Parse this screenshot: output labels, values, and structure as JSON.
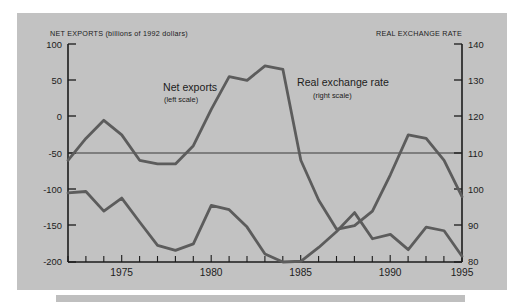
{
  "figure": {
    "left_header": "NET EXPORTS (billions of 1992 dollars)",
    "right_header": "REAL EXCHANGE RATE",
    "panel_color": "#c2c2c2",
    "line_color": "#5c5c5c",
    "axis_color": "#1b1b1b"
  },
  "annotations": {
    "net_exports_label": "Net exports",
    "net_exports_sub": "(left scale)",
    "real_rate_label": "Real exchange rate",
    "real_rate_sub": "(right scale)"
  },
  "axis": {
    "left_ticks": [
      "100",
      "50",
      "0",
      "-50",
      "-100",
      "-150",
      "-200"
    ],
    "right_ticks": [
      "140",
      "130",
      "120",
      "110",
      "100",
      "90",
      "80"
    ],
    "x_ticks": [
      "1975",
      "1980",
      "1985",
      "1990",
      "1995"
    ]
  },
  "chart_data": {
    "type": "line",
    "xlabel": "",
    "ylabel": "Net exports (billions of 1992 dollars)",
    "y2label": "Real exchange rate",
    "xlim": [
      1973,
      1995
    ],
    "ylim": [
      -200,
      100
    ],
    "y2lim": [
      80,
      140
    ],
    "yticks": [
      -200,
      -150,
      -100,
      -50,
      0,
      50,
      100
    ],
    "y2ticks": [
      80,
      90,
      100,
      110,
      120,
      130,
      140
    ],
    "xticks": [
      1975,
      1980,
      1985,
      1990,
      1995
    ],
    "grid": false,
    "legend": "inline-annotations",
    "x": [
      1973,
      1974,
      1975,
      1976,
      1977,
      1978,
      1979,
      1980,
      1981,
      1982,
      1983,
      1984,
      1985,
      1986,
      1987,
      1988,
      1989,
      1990,
      1991,
      1992,
      1993,
      1994,
      1995
    ],
    "series": [
      {
        "name": "Net exports",
        "axis": "left",
        "units": "billions of 1992 dollars",
        "values": [
          -105,
          -103,
          -130,
          -112,
          -145,
          -177,
          -184,
          -175,
          -122,
          -128,
          -152,
          -189,
          -200,
          -199,
          -180,
          -158,
          -132,
          -168,
          -162,
          -183,
          -152,
          -157,
          -192
        ]
      },
      {
        "name": "Real exchange rate",
        "axis": "right",
        "units": "index",
        "values": [
          108,
          114,
          119,
          115,
          108,
          107,
          107,
          112,
          122,
          131,
          130,
          134,
          133,
          108,
          97,
          89,
          90,
          94,
          104,
          115,
          114,
          108,
          98
        ]
      }
    ]
  }
}
